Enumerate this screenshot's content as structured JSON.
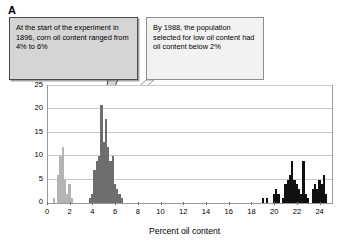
{
  "panel": {
    "label": "A"
  },
  "callouts": [
    {
      "id": "callout-1896",
      "text": "At the start of the experiment in 1896, corn oil content ranged from 4% to 6%"
    },
    {
      "id": "callout-1988",
      "text": "By 1988, the population selected for low oil content had oil content below 2%"
    },
    {
      "id": "callout-2004",
      "text": "By 2004, the population selected for high oil content had content near or above 20%"
    }
  ],
  "chart_data": {
    "type": "bar",
    "title": "",
    "xlabel": "Percent oil content",
    "ylabel": "Number of ears",
    "xlim": [
      0,
      25
    ],
    "ylim": [
      0,
      25
    ],
    "xticks": [
      0,
      2,
      4,
      6,
      8,
      10,
      12,
      14,
      16,
      18,
      20,
      22,
      24
    ],
    "yticks": [
      0,
      5,
      10,
      15,
      20,
      25
    ],
    "grid": "horizontal",
    "legend": "none",
    "bin_width": 0.2,
    "series": [
      {
        "name": "1988 low-oil population",
        "color": "#b4b4b4",
        "points": [
          {
            "x": 0.5,
            "y": 1
          },
          {
            "x": 0.9,
            "y": 6
          },
          {
            "x": 1.1,
            "y": 10
          },
          {
            "x": 1.3,
            "y": 12
          },
          {
            "x": 1.5,
            "y": 5
          },
          {
            "x": 1.7,
            "y": 2
          },
          {
            "x": 1.9,
            "y": 4
          },
          {
            "x": 2.1,
            "y": 1
          }
        ]
      },
      {
        "name": "1896 original population",
        "color": "#6e6e6e",
        "points": [
          {
            "x": 3.7,
            "y": 1
          },
          {
            "x": 3.9,
            "y": 2
          },
          {
            "x": 4.1,
            "y": 7
          },
          {
            "x": 4.3,
            "y": 9
          },
          {
            "x": 4.5,
            "y": 10
          },
          {
            "x": 4.7,
            "y": 21
          },
          {
            "x": 4.9,
            "y": 13
          },
          {
            "x": 5.1,
            "y": 18
          },
          {
            "x": 5.3,
            "y": 12
          },
          {
            "x": 5.5,
            "y": 9
          },
          {
            "x": 5.7,
            "y": 10
          },
          {
            "x": 5.9,
            "y": 4
          },
          {
            "x": 6.1,
            "y": 3
          },
          {
            "x": 6.3,
            "y": 2
          },
          {
            "x": 6.5,
            "y": 1
          }
        ]
      },
      {
        "name": "2004 high-oil population",
        "color": "#101010",
        "points": [
          {
            "x": 18.9,
            "y": 1
          },
          {
            "x": 19.3,
            "y": 1
          },
          {
            "x": 19.9,
            "y": 2
          },
          {
            "x": 20.1,
            "y": 3
          },
          {
            "x": 20.3,
            "y": 2
          },
          {
            "x": 20.7,
            "y": 1
          },
          {
            "x": 20.9,
            "y": 4
          },
          {
            "x": 21.1,
            "y": 5
          },
          {
            "x": 21.3,
            "y": 6
          },
          {
            "x": 21.5,
            "y": 9
          },
          {
            "x": 21.7,
            "y": 5
          },
          {
            "x": 21.9,
            "y": 4
          },
          {
            "x": 22.1,
            "y": 3
          },
          {
            "x": 22.3,
            "y": 2
          },
          {
            "x": 22.5,
            "y": 9
          },
          {
            "x": 22.7,
            "y": 2
          },
          {
            "x": 22.9,
            "y": 1
          },
          {
            "x": 23.3,
            "y": 3
          },
          {
            "x": 23.5,
            "y": 4
          },
          {
            "x": 23.7,
            "y": 3
          },
          {
            "x": 23.9,
            "y": 5
          },
          {
            "x": 24.1,
            "y": 4
          },
          {
            "x": 24.3,
            "y": 6
          },
          {
            "x": 24.5,
            "y": 2
          }
        ]
      }
    ]
  }
}
